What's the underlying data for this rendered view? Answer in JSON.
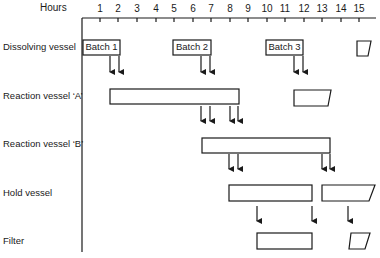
{
  "axis": {
    "title": "Hours",
    "ticks": [
      "1",
      "2",
      "3",
      "4",
      "5",
      "6",
      "7",
      "8",
      "9",
      "10",
      "11",
      "12",
      "13",
      "14",
      "15"
    ],
    "tick_x": [
      100,
      118,
      137,
      156,
      174,
      193,
      211,
      230,
      248,
      267,
      285,
      304,
      322,
      341,
      359
    ]
  },
  "rows": [
    {
      "label": "Dissolving vessel",
      "y": 48
    },
    {
      "label": "Reaction vessel ‘A’",
      "y": 97
    },
    {
      "label": "Reaction vessel ‘B’",
      "y": 145
    },
    {
      "label": "Hold vessel",
      "y": 193
    },
    {
      "label": "Filter",
      "y": 241
    }
  ],
  "batches": [
    {
      "label": "Batch 1"
    },
    {
      "label": "Batch 2"
    },
    {
      "label": "Batch 3"
    }
  ]
}
